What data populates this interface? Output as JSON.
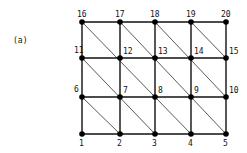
{
  "panel_label": "(a)",
  "columns_x": [
    82,
    120,
    155,
    191,
    226
  ],
  "rows_y": [
    134,
    97,
    58,
    22
  ],
  "nodes": [
    {
      "id": "1",
      "col": 0,
      "row": 0
    },
    {
      "id": "2",
      "col": 1,
      "row": 0
    },
    {
      "id": "3",
      "col": 2,
      "row": 0
    },
    {
      "id": "4",
      "col": 3,
      "row": 0
    },
    {
      "id": "5",
      "col": 4,
      "row": 0
    },
    {
      "id": "6",
      "col": 0,
      "row": 1
    },
    {
      "id": "7",
      "col": 1,
      "row": 1
    },
    {
      "id": "8",
      "col": 2,
      "row": 1
    },
    {
      "id": "9",
      "col": 3,
      "row": 1
    },
    {
      "id": "10",
      "col": 4,
      "row": 1
    },
    {
      "id": "11",
      "col": 0,
      "row": 2
    },
    {
      "id": "12",
      "col": 1,
      "row": 2
    },
    {
      "id": "13",
      "col": 2,
      "row": 2
    },
    {
      "id": "14",
      "col": 3,
      "row": 2
    },
    {
      "id": "15",
      "col": 4,
      "row": 2
    },
    {
      "id": "16",
      "col": 0,
      "row": 3
    },
    {
      "id": "17",
      "col": 1,
      "row": 3
    },
    {
      "id": "18",
      "col": 2,
      "row": 3
    },
    {
      "id": "19",
      "col": 3,
      "row": 3
    },
    {
      "id": "20",
      "col": 4,
      "row": 3
    }
  ],
  "edge_style": {
    "grid": "solid",
    "diagonal": "thin"
  },
  "diagonals": [
    [
      "16",
      "12",
      "8",
      "4"
    ],
    [
      "17",
      "13",
      "9",
      "5"
    ],
    [
      "18",
      "14",
      "10"
    ],
    [
      "19",
      "15"
    ],
    [
      "11",
      "7",
      "3"
    ],
    [
      "6",
      "2"
    ]
  ]
}
